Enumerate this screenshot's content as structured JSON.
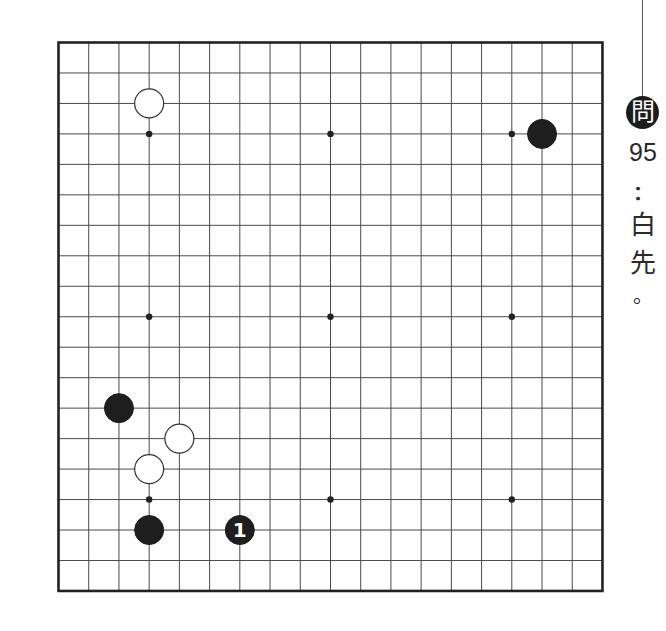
{
  "board": {
    "size": 19,
    "origin_x": 58.5,
    "origin_y": 42.5,
    "spacing_x": 30.22,
    "spacing_y": 30.47,
    "line_color": "#4a4a4a",
    "border_color": "#222222",
    "star_points": [
      [
        3,
        3
      ],
      [
        9,
        3
      ],
      [
        15,
        3
      ],
      [
        3,
        9
      ],
      [
        9,
        9
      ],
      [
        15,
        9
      ],
      [
        3,
        15
      ],
      [
        9,
        15
      ],
      [
        15,
        15
      ]
    ],
    "stones": [
      {
        "color": "white",
        "col": 3,
        "row": 2,
        "label": ""
      },
      {
        "color": "black",
        "col": 16,
        "row": 3,
        "label": ""
      },
      {
        "color": "black",
        "col": 2,
        "row": 12,
        "label": ""
      },
      {
        "color": "white",
        "col": 4,
        "row": 13,
        "label": ""
      },
      {
        "color": "white",
        "col": 3,
        "row": 14,
        "label": ""
      },
      {
        "color": "black",
        "col": 3,
        "row": 16,
        "label": ""
      },
      {
        "color": "black",
        "col": 6,
        "row": 16,
        "label": "1"
      }
    ]
  },
  "problem": {
    "badge": "問",
    "number": "95",
    "colon": "：",
    "text_chars": [
      "白",
      "先"
    ],
    "period": "。"
  }
}
